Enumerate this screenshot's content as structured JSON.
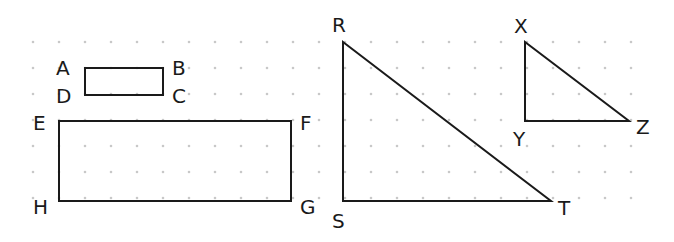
{
  "grid": {
    "spacing": 26,
    "origin_x": 33,
    "origin_y": 42,
    "cols": 24,
    "rows": 7,
    "dot_color": "#c8c8c8"
  },
  "shapes": [
    {
      "name": "rectangle-abcd",
      "type": "polygon",
      "points": [
        [
          85,
          68
        ],
        [
          163,
          68
        ],
        [
          163,
          95
        ],
        [
          85,
          95
        ]
      ],
      "labels": [
        {
          "text": "A",
          "x": 56,
          "y": 75
        },
        {
          "text": "B",
          "x": 172,
          "y": 75
        },
        {
          "text": "C",
          "x": 172,
          "y": 103
        },
        {
          "text": "D",
          "x": 56,
          "y": 103
        }
      ]
    },
    {
      "name": "rectangle-efgh",
      "type": "polygon",
      "points": [
        [
          59,
          121
        ],
        [
          291,
          121
        ],
        [
          291,
          201
        ],
        [
          59,
          201
        ]
      ],
      "labels": [
        {
          "text": "E",
          "x": 33,
          "y": 130
        },
        {
          "text": "F",
          "x": 300,
          "y": 130
        },
        {
          "text": "G",
          "x": 300,
          "y": 214
        },
        {
          "text": "H",
          "x": 33,
          "y": 214
        }
      ]
    },
    {
      "name": "triangle-rst",
      "type": "polygon",
      "points": [
        [
          343,
          42
        ],
        [
          343,
          201
        ],
        [
          551,
          201
        ]
      ],
      "labels": [
        {
          "text": "R",
          "x": 332,
          "y": 32
        },
        {
          "text": "S",
          "x": 332,
          "y": 228
        },
        {
          "text": "T",
          "x": 558,
          "y": 215
        }
      ]
    },
    {
      "name": "triangle-xyz",
      "type": "polygon",
      "points": [
        [
          525,
          42
        ],
        [
          525,
          121
        ],
        [
          629,
          121
        ]
      ],
      "labels": [
        {
          "text": "X",
          "x": 514,
          "y": 33
        },
        {
          "text": "Y",
          "x": 513,
          "y": 146
        },
        {
          "text": "Z",
          "x": 636,
          "y": 134
        }
      ]
    }
  ],
  "stroke_color": "#1a1a1a"
}
